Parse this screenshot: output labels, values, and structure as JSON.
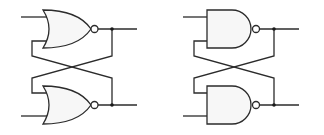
{
  "diagram": {
    "title": "",
    "colors": {
      "stroke": "#2b2b2b",
      "gate_fill": "#f7f7f7",
      "background": "#ffffff",
      "junction": "#1a1a1a"
    },
    "latches": [
      {
        "name": "SR latch (NOR)",
        "gate_type": "NOR",
        "gates": [
          "top NOR gate",
          "bottom NOR gate"
        ],
        "cross_coupled": true
      },
      {
        "name": "SR latch (NAND)",
        "gate_type": "NAND",
        "gates": [
          "top NAND gate",
          "bottom NAND gate"
        ],
        "cross_coupled": true
      }
    ]
  }
}
